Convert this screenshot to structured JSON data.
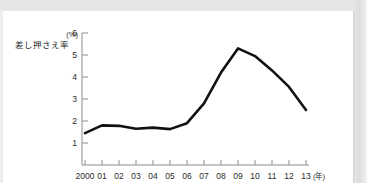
{
  "chart_data": {
    "type": "line",
    "title": "",
    "subtitle": "",
    "ylabel": "差し押さえ率",
    "yunit": "(%)",
    "xlabel": "(年)",
    "categories": [
      "2000",
      "01",
      "02",
      "03",
      "04",
      "05",
      "06",
      "07",
      "08",
      "09",
      "10",
      "11",
      "12",
      "13"
    ],
    "x": [
      2000,
      2001,
      2002,
      2003,
      2004,
      2005,
      2006,
      2007,
      2008,
      2009,
      2010,
      2011,
      2012,
      2013
    ],
    "values": [
      1.45,
      1.8,
      1.78,
      1.65,
      1.7,
      1.63,
      1.9,
      2.8,
      4.2,
      5.3,
      4.95,
      4.3,
      3.55,
      2.5
    ],
    "series": [
      {
        "name": "差し押さえ率",
        "values": [
          1.45,
          1.8,
          1.78,
          1.65,
          1.7,
          1.63,
          1.9,
          2.8,
          4.2,
          5.3,
          4.95,
          4.3,
          3.55,
          2.5
        ]
      }
    ],
    "yticks": [
      1,
      2,
      3,
      4,
      5,
      6
    ],
    "ytick_labels": [
      "1",
      "2",
      "3",
      "4",
      "5",
      "6"
    ],
    "ylim": [
      0,
      6
    ],
    "xlim": [
      2000,
      2013
    ],
    "grid": false,
    "legend": false,
    "legend_position": "none",
    "line_color": "#111111",
    "axis_color": "#8d8d8d",
    "background": "#ffffff"
  }
}
